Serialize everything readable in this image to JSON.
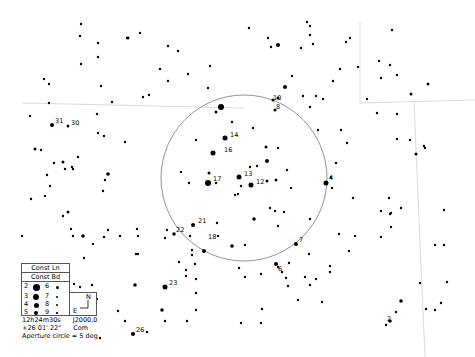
{
  "map": {
    "background": "#ffffff",
    "star_color": "#000000",
    "line_color": "#999999",
    "aperture_circle": {
      "cx": 244,
      "cy": 178,
      "r": 83,
      "color": "#777777"
    },
    "boundary_lines": [
      {
        "points": "22,103 244,108"
      },
      {
        "points": "360,22 360,103 475,100"
      },
      {
        "points": "414,103 425,357"
      }
    ],
    "stars": [
      {
        "x": 221,
        "y": 107,
        "r": 3
      },
      {
        "x": 216,
        "y": 112,
        "r": 1.5
      },
      {
        "x": 273,
        "y": 100,
        "r": 1.5
      },
      {
        "x": 275,
        "y": 110,
        "r": 1.5
      },
      {
        "x": 225,
        "y": 138,
        "r": 2.5
      },
      {
        "x": 213,
        "y": 153,
        "r": 2.5
      },
      {
        "x": 266,
        "y": 147,
        "r": 1.5
      },
      {
        "x": 267,
        "y": 161,
        "r": 2
      },
      {
        "x": 239,
        "y": 177,
        "r": 2.5
      },
      {
        "x": 208,
        "y": 183,
        "r": 3
      },
      {
        "x": 251,
        "y": 185,
        "r": 2.5
      },
      {
        "x": 267,
        "y": 181,
        "r": 1.5
      },
      {
        "x": 276,
        "y": 180,
        "r": 1.5
      },
      {
        "x": 209,
        "y": 173,
        "r": 1.5
      },
      {
        "x": 216,
        "y": 183,
        "r": 1.2
      },
      {
        "x": 241,
        "y": 186,
        "r": 1.2
      },
      {
        "x": 238,
        "y": 194,
        "r": 1.2
      },
      {
        "x": 235,
        "y": 195,
        "r": 1.2
      },
      {
        "x": 204,
        "y": 251,
        "r": 2
      },
      {
        "x": 193,
        "y": 225,
        "r": 2
      },
      {
        "x": 174,
        "y": 234,
        "r": 1.8
      },
      {
        "x": 232,
        "y": 246,
        "r": 1.8
      },
      {
        "x": 254,
        "y": 219,
        "r": 1.8
      },
      {
        "x": 296,
        "y": 244,
        "r": 2
      },
      {
        "x": 326,
        "y": 183,
        "r": 2.5
      },
      {
        "x": 285,
        "y": 87,
        "r": 2
      },
      {
        "x": 278,
        "y": 98,
        "r": 1.5
      },
      {
        "x": 52,
        "y": 125,
        "r": 2
      },
      {
        "x": 68,
        "y": 126,
        "r": 1.5
      },
      {
        "x": 35,
        "y": 149,
        "r": 1.5
      },
      {
        "x": 41,
        "y": 150,
        "r": 1.2
      },
      {
        "x": 63,
        "y": 162,
        "r": 1.5
      },
      {
        "x": 108,
        "y": 174,
        "r": 1.8
      },
      {
        "x": 68,
        "y": 212,
        "r": 1.5
      },
      {
        "x": 83,
        "y": 236,
        "r": 1.8
      },
      {
        "x": 232,
        "y": 122,
        "r": 1.2
      },
      {
        "x": 253,
        "y": 128,
        "r": 1.2
      },
      {
        "x": 250,
        "y": 167,
        "r": 1.2
      },
      {
        "x": 257,
        "y": 166,
        "r": 1.2
      },
      {
        "x": 278,
        "y": 148,
        "r": 1.2
      },
      {
        "x": 287,
        "y": 170,
        "r": 1.2
      },
      {
        "x": 291,
        "y": 188,
        "r": 1.2
      },
      {
        "x": 196,
        "y": 140,
        "r": 1.2
      },
      {
        "x": 181,
        "y": 172,
        "r": 1.2
      },
      {
        "x": 189,
        "y": 183,
        "r": 1.2
      },
      {
        "x": 270,
        "y": 208,
        "r": 1.2
      },
      {
        "x": 275,
        "y": 211,
        "r": 1.2
      },
      {
        "x": 278,
        "y": 226,
        "r": 1.2
      },
      {
        "x": 284,
        "y": 212,
        "r": 1.2
      },
      {
        "x": 245,
        "y": 245,
        "r": 1.2
      },
      {
        "x": 218,
        "y": 236,
        "r": 1.2
      },
      {
        "x": 190,
        "y": 236,
        "r": 1.2
      },
      {
        "x": 217,
        "y": 223,
        "r": 1.2
      },
      {
        "x": 165,
        "y": 238,
        "r": 1.2
      },
      {
        "x": 192,
        "y": 255,
        "r": 1.2
      },
      {
        "x": 192,
        "y": 250,
        "r": 1.2
      },
      {
        "x": 128,
        "y": 38,
        "r": 1.5
      },
      {
        "x": 127,
        "y": 38,
        "r": 1.2
      },
      {
        "x": 80,
        "y": 36,
        "r": 1.2
      },
      {
        "x": 81,
        "y": 24,
        "r": 1.2
      },
      {
        "x": 98,
        "y": 43,
        "r": 1.2
      },
      {
        "x": 98,
        "y": 57,
        "r": 1.2
      },
      {
        "x": 81,
        "y": 64,
        "r": 1.2
      },
      {
        "x": 44,
        "y": 79,
        "r": 1.2
      },
      {
        "x": 49,
        "y": 84,
        "r": 1.2
      },
      {
        "x": 101,
        "y": 86,
        "r": 1.2
      },
      {
        "x": 140,
        "y": 33,
        "r": 1.2
      },
      {
        "x": 168,
        "y": 46,
        "r": 1.2
      },
      {
        "x": 178,
        "y": 51,
        "r": 1.2
      },
      {
        "x": 160,
        "y": 69,
        "r": 1.2
      },
      {
        "x": 188,
        "y": 74,
        "r": 1.2
      },
      {
        "x": 168,
        "y": 81,
        "r": 1.2
      },
      {
        "x": 210,
        "y": 66,
        "r": 1.2
      },
      {
        "x": 143,
        "y": 97,
        "r": 1.2
      },
      {
        "x": 149,
        "y": 95,
        "r": 1.2
      },
      {
        "x": 208,
        "y": 88,
        "r": 1.2
      },
      {
        "x": 278,
        "y": 45,
        "r": 2
      },
      {
        "x": 249,
        "y": 28,
        "r": 1.2
      },
      {
        "x": 268,
        "y": 38,
        "r": 1.2
      },
      {
        "x": 271,
        "y": 47,
        "r": 1.2
      },
      {
        "x": 301,
        "y": 48,
        "r": 1.2
      },
      {
        "x": 307,
        "y": 22,
        "r": 1.2
      },
      {
        "x": 310,
        "y": 26,
        "r": 1.2
      },
      {
        "x": 310,
        "y": 35,
        "r": 1.2
      },
      {
        "x": 313,
        "y": 44,
        "r": 1.2
      },
      {
        "x": 346,
        "y": 42,
        "r": 1.2
      },
      {
        "x": 350,
        "y": 38,
        "r": 1.2
      },
      {
        "x": 340,
        "y": 69,
        "r": 1.2
      },
      {
        "x": 358,
        "y": 67,
        "r": 1.2
      },
      {
        "x": 333,
        "y": 81,
        "r": 1.2
      },
      {
        "x": 303,
        "y": 96,
        "r": 1.2
      },
      {
        "x": 316,
        "y": 96,
        "r": 1.2
      },
      {
        "x": 323,
        "y": 99,
        "r": 1.2
      },
      {
        "x": 310,
        "y": 107,
        "r": 1.2
      },
      {
        "x": 292,
        "y": 76,
        "r": 1.2
      },
      {
        "x": 392,
        "y": 30,
        "r": 1.2
      },
      {
        "x": 379,
        "y": 61,
        "r": 1.2
      },
      {
        "x": 390,
        "y": 65,
        "r": 1.2
      },
      {
        "x": 381,
        "y": 78,
        "r": 1.2
      },
      {
        "x": 397,
        "y": 75,
        "r": 1.2
      },
      {
        "x": 428,
        "y": 84,
        "r": 1.5
      },
      {
        "x": 367,
        "y": 99,
        "r": 1.2
      },
      {
        "x": 377,
        "y": 113,
        "r": 1.2
      },
      {
        "x": 397,
        "y": 114,
        "r": 1.2
      },
      {
        "x": 411,
        "y": 94,
        "r": 1.5
      },
      {
        "x": 397,
        "y": 139,
        "r": 1.2
      },
      {
        "x": 410,
        "y": 140,
        "r": 1.2
      },
      {
        "x": 416,
        "y": 154,
        "r": 1.5
      },
      {
        "x": 424,
        "y": 146,
        "r": 1.2
      },
      {
        "x": 425,
        "y": 148,
        "r": 1.2
      },
      {
        "x": 336,
        "y": 163,
        "r": 1.2
      },
      {
        "x": 331,
        "y": 177,
        "r": 1.2
      },
      {
        "x": 332,
        "y": 188,
        "r": 1.2
      },
      {
        "x": 353,
        "y": 198,
        "r": 1.2
      },
      {
        "x": 389,
        "y": 198,
        "r": 1.2
      },
      {
        "x": 381,
        "y": 211,
        "r": 1.2
      },
      {
        "x": 390,
        "y": 214,
        "r": 1.2
      },
      {
        "x": 391,
        "y": 227,
        "r": 1.2
      },
      {
        "x": 381,
        "y": 237,
        "r": 1.2
      },
      {
        "x": 310,
        "y": 219,
        "r": 1.2
      },
      {
        "x": 339,
        "y": 234,
        "r": 1.2
      },
      {
        "x": 355,
        "y": 236,
        "r": 1.2
      },
      {
        "x": 309,
        "y": 254,
        "r": 1.2
      },
      {
        "x": 330,
        "y": 266,
        "r": 1.2
      },
      {
        "x": 349,
        "y": 251,
        "r": 1.2
      },
      {
        "x": 330,
        "y": 272,
        "r": 1.2
      },
      {
        "x": 401,
        "y": 208,
        "r": 1.2
      },
      {
        "x": 391,
        "y": 213,
        "r": 1.2
      },
      {
        "x": 420,
        "y": 283,
        "r": 1.2
      },
      {
        "x": 444,
        "y": 210,
        "r": 1.2
      },
      {
        "x": 447,
        "y": 282,
        "r": 1.2
      },
      {
        "x": 441,
        "y": 303,
        "r": 1.2
      },
      {
        "x": 435,
        "y": 310,
        "r": 1.2
      },
      {
        "x": 401,
        "y": 301,
        "r": 1.8
      },
      {
        "x": 396,
        "y": 312,
        "r": 1.2
      },
      {
        "x": 390,
        "y": 321,
        "r": 1.8
      },
      {
        "x": 386,
        "y": 325,
        "r": 1.2
      },
      {
        "x": 426,
        "y": 309,
        "r": 1.2
      },
      {
        "x": 444,
        "y": 245,
        "r": 1.2
      },
      {
        "x": 435,
        "y": 245,
        "r": 1.2
      },
      {
        "x": 276,
        "y": 264,
        "r": 2
      },
      {
        "x": 278,
        "y": 267,
        "r": 1.2
      },
      {
        "x": 282,
        "y": 272,
        "r": 1.2
      },
      {
        "x": 298,
        "y": 300,
        "r": 1.2
      },
      {
        "x": 322,
        "y": 302,
        "r": 1.2
      },
      {
        "x": 305,
        "y": 277,
        "r": 1.2
      },
      {
        "x": 316,
        "y": 279,
        "r": 1.2
      },
      {
        "x": 310,
        "y": 285,
        "r": 1.2
      },
      {
        "x": 261,
        "y": 274,
        "r": 1.2
      },
      {
        "x": 286,
        "y": 278,
        "r": 1.2
      },
      {
        "x": 289,
        "y": 263,
        "r": 1.2
      },
      {
        "x": 288,
        "y": 286,
        "r": 1.2
      },
      {
        "x": 245,
        "y": 277,
        "r": 1.2
      },
      {
        "x": 239,
        "y": 268,
        "r": 1.2
      },
      {
        "x": 195,
        "y": 264,
        "r": 1.2
      },
      {
        "x": 165,
        "y": 287,
        "r": 2.5
      },
      {
        "x": 135,
        "y": 285,
        "r": 1.8
      },
      {
        "x": 162,
        "y": 310,
        "r": 1.8
      },
      {
        "x": 186,
        "y": 276,
        "r": 1.2
      },
      {
        "x": 186,
        "y": 270,
        "r": 1.2
      },
      {
        "x": 179,
        "y": 262,
        "r": 1.2
      },
      {
        "x": 196,
        "y": 279,
        "r": 1.2
      },
      {
        "x": 196,
        "y": 293,
        "r": 1.2
      },
      {
        "x": 196,
        "y": 310,
        "r": 1.2
      },
      {
        "x": 187,
        "y": 321,
        "r": 1.2
      },
      {
        "x": 165,
        "y": 321,
        "r": 1.2
      },
      {
        "x": 125,
        "y": 321,
        "r": 1.2
      },
      {
        "x": 118,
        "y": 311,
        "r": 1.2
      },
      {
        "x": 138,
        "y": 254,
        "r": 1.2
      },
      {
        "x": 133,
        "y": 334,
        "r": 2
      },
      {
        "x": 147,
        "y": 332,
        "r": 1.2
      },
      {
        "x": 138,
        "y": 236,
        "r": 1.2
      },
      {
        "x": 167,
        "y": 230,
        "r": 1.2
      },
      {
        "x": 104,
        "y": 237,
        "r": 1.2
      },
      {
        "x": 120,
        "y": 236,
        "r": 1.2
      },
      {
        "x": 54,
        "y": 163,
        "r": 1.2
      },
      {
        "x": 47,
        "y": 175,
        "r": 1.2
      },
      {
        "x": 50,
        "y": 186,
        "r": 1.2
      },
      {
        "x": 45,
        "y": 196,
        "r": 1.2
      },
      {
        "x": 31,
        "y": 199,
        "r": 1.2
      },
      {
        "x": 73,
        "y": 169,
        "r": 1.2
      },
      {
        "x": 72,
        "y": 167,
        "r": 1.2
      },
      {
        "x": 103,
        "y": 191,
        "r": 1.2
      },
      {
        "x": 105,
        "y": 180,
        "r": 1.2
      },
      {
        "x": 65,
        "y": 169,
        "r": 1.2
      },
      {
        "x": 73,
        "y": 236,
        "r": 1.2
      },
      {
        "x": 93,
        "y": 244,
        "r": 1.2
      },
      {
        "x": 108,
        "y": 230,
        "r": 1.2
      },
      {
        "x": 137,
        "y": 229,
        "r": 1.2
      },
      {
        "x": 136,
        "y": 254,
        "r": 1.2
      },
      {
        "x": 30,
        "y": 116,
        "r": 1.2
      },
      {
        "x": 49,
        "y": 103,
        "r": 1.2
      },
      {
        "x": 78,
        "y": 157,
        "r": 1.2
      },
      {
        "x": 97,
        "y": 114,
        "r": 1.2
      },
      {
        "x": 104,
        "y": 136,
        "r": 1.2
      },
      {
        "x": 98,
        "y": 133,
        "r": 1.2
      },
      {
        "x": 125,
        "y": 142,
        "r": 1.2
      },
      {
        "x": 63,
        "y": 216,
        "r": 1.2
      },
      {
        "x": 71,
        "y": 229,
        "r": 1.2
      },
      {
        "x": 22,
        "y": 236,
        "r": 1.2
      },
      {
        "x": 112,
        "y": 102,
        "r": 1.2
      },
      {
        "x": 92,
        "y": 285,
        "r": 1.2
      },
      {
        "x": 97,
        "y": 299,
        "r": 1.2
      },
      {
        "x": 100,
        "y": 338,
        "r": 1.2
      },
      {
        "x": 84,
        "y": 258,
        "r": 1.2
      },
      {
        "x": 74,
        "y": 284,
        "r": 1.2
      },
      {
        "x": 80,
        "y": 287,
        "r": 1.2
      },
      {
        "x": 241,
        "y": 323,
        "r": 1.2
      },
      {
        "x": 261,
        "y": 323,
        "r": 1.2
      },
      {
        "x": 262,
        "y": 309,
        "r": 1.2
      },
      {
        "x": 318,
        "y": 130,
        "r": 1.2
      },
      {
        "x": 341,
        "y": 130,
        "r": 1.2
      },
      {
        "x": 347,
        "y": 143,
        "r": 1.2
      }
    ],
    "labels": [
      {
        "x": 271,
        "y": 101,
        "text": "10"
      },
      {
        "x": 274,
        "y": 110,
        "text": "8"
      },
      {
        "x": 228,
        "y": 138,
        "text": "14"
      },
      {
        "x": 222,
        "y": 153,
        "text": "16"
      },
      {
        "x": 242,
        "y": 177,
        "text": "13"
      },
      {
        "x": 211,
        "y": 182,
        "text": "17"
      },
      {
        "x": 254,
        "y": 185,
        "text": "12"
      },
      {
        "x": 327,
        "y": 181,
        "text": "4"
      },
      {
        "x": 196,
        "y": 224,
        "text": "21"
      },
      {
        "x": 174,
        "y": 233,
        "text": "22"
      },
      {
        "x": 206,
        "y": 240,
        "text": "18"
      },
      {
        "x": 297,
        "y": 243,
        "text": "7"
      },
      {
        "x": 276,
        "y": 272,
        "text": "6"
      },
      {
        "x": 167,
        "y": 286,
        "text": "23"
      },
      {
        "x": 134,
        "y": 333,
        "text": "26"
      },
      {
        "x": 385,
        "y": 322,
        "text": "2"
      },
      {
        "x": 53,
        "y": 124,
        "text": "31"
      },
      {
        "x": 69,
        "y": 126,
        "text": "30"
      }
    ]
  },
  "legend": {
    "const_lines_label": "Const Ln",
    "const_bounds_label": "Const Bd",
    "magnitudes": [
      {
        "mag": "2",
        "size": 7
      },
      {
        "mag": "3",
        "size": 6
      },
      {
        "mag": "4",
        "size": 5
      },
      {
        "mag": "5",
        "size": 4
      },
      {
        "mag": "6",
        "size": 3
      },
      {
        "mag": "7",
        "size": 2.5
      },
      {
        "mag": "8",
        "size": 2
      },
      {
        "mag": "9",
        "size": 1.5
      }
    ],
    "compass": {
      "north": "N",
      "east": "E"
    }
  },
  "info": {
    "ra": "12h24m30s",
    "epoch": "J2000.0",
    "dec": "+26 01' 22\"",
    "constellation": "Com",
    "aperture": "Aperture circle = 5 deg"
  }
}
